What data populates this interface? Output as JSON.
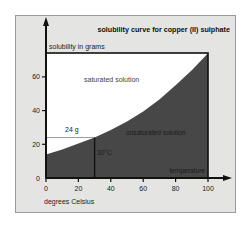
{
  "chart_data": {
    "type": "area",
    "title": "solubility curve for copper (II) sulphate",
    "ylabel": "solubility in grams",
    "xlabel": "degrees Celsius",
    "x_axis_caption": "temperature",
    "x_ticks": [
      "0",
      "20",
      "40",
      "60",
      "80",
      "100"
    ],
    "y_ticks": [
      "0",
      "20",
      "40",
      "60"
    ],
    "xlim": [
      0,
      100
    ],
    "ylim": [
      0,
      74
    ],
    "grid": false,
    "x": [
      0,
      10,
      20,
      30,
      40,
      50,
      60,
      70,
      80,
      90,
      100
    ],
    "series": [
      {
        "name": "solubility (g)",
        "values": [
          14,
          17,
          20.5,
          24,
          28.5,
          33.5,
          39.5,
          46.5,
          55,
          64,
          74
        ]
      }
    ],
    "regions": [
      {
        "label": "saturated solution",
        "position": "above curve",
        "color": "#ffffff"
      },
      {
        "label": "unsaturated solution",
        "position": "below curve",
        "color": "#474747"
      }
    ],
    "annotations": [
      {
        "label": "24 g",
        "type": "horizontal reference",
        "y": 24,
        "x_range": [
          0,
          30
        ]
      },
      {
        "label": "30°C",
        "type": "vertical reference",
        "x": 30,
        "y_range": [
          0,
          24
        ]
      }
    ]
  },
  "labels": {
    "title": "solubility curve for copper (II) sulphate",
    "ylabel": "solubility in grams",
    "xlabel": "degrees Celsius",
    "x_caption": "temperature",
    "saturated": "saturated solution",
    "unsaturated": "unsaturated solution",
    "ref_24g": "24 g",
    "ref_30c": "30°C",
    "x_ticks": [
      "0",
      "20",
      "40",
      "60",
      "80",
      "100"
    ],
    "y_ticks": [
      "0",
      "20",
      "40",
      "60"
    ]
  },
  "colors": {
    "panel": "#e4e4e2",
    "dark_area": "#474747",
    "light_area": "#ffffff",
    "axis": "#111111"
  }
}
